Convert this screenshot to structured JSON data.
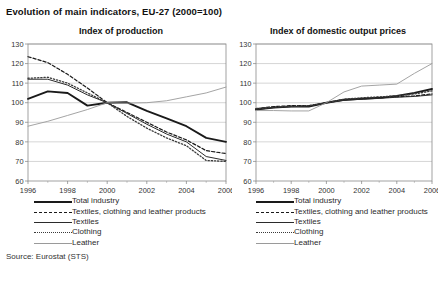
{
  "page_title": "Evolution of main indicators, EU-27 (2000=100)",
  "source_note": "Source: Eurostat (STS)",
  "legend": {
    "items": [
      {
        "label": "Total industry",
        "style": "solid-thick-black",
        "color": "#1a1a1a"
      },
      {
        "label": "Textiles, clothing and leather products",
        "style": "dashed-black",
        "color": "#1a1a1a"
      },
      {
        "label": "Textiles",
        "style": "solid-thick-dark",
        "color": "#2b2b2b"
      },
      {
        "label": "Clothing",
        "style": "dotted-dark",
        "color": "#3a3a3a"
      },
      {
        "label": "Leather",
        "style": "solid-thin-grey",
        "color": "#9a9a9a"
      }
    ]
  },
  "chart_data": [
    {
      "id": "index-of-production",
      "type": "line",
      "title": "Index of production",
      "xlabel": "",
      "ylabel": "",
      "x": [
        1996,
        1997,
        1998,
        1999,
        2000,
        2001,
        2002,
        2003,
        2004,
        2005,
        2006
      ],
      "tick_labels_x": [
        "1996",
        "1998",
        "2000",
        "2002",
        "2004",
        "2006"
      ],
      "tick_values_x": [
        1996,
        1998,
        2000,
        2002,
        2004,
        2006
      ],
      "tick_values_y": [
        60,
        70,
        80,
        90,
        100,
        110,
        120,
        130
      ],
      "ylim": [
        60,
        130
      ],
      "xlim": [
        1996,
        2006
      ],
      "grid": true,
      "legend_position": "below",
      "series": [
        {
          "name": "Total industry",
          "style": "solid-thick-black",
          "color": "#1a1a1a",
          "values": [
            102.0,
            105.8,
            105.0,
            98.5,
            100.0,
            100.2,
            95.8,
            92.0,
            88.0,
            82.0,
            80.0
          ]
        },
        {
          "name": "Textiles, clothing and leather products",
          "style": "dashed-black",
          "color": "#1a1a1a",
          "values": [
            123.5,
            120.5,
            114.5,
            107.5,
            100.0,
            95.0,
            90.0,
            85.0,
            81.0,
            75.5,
            74.0
          ]
        },
        {
          "name": "Textiles",
          "style": "solid-thick-dark",
          "color": "#2b2b2b",
          "values": [
            112.0,
            112.0,
            109.0,
            104.0,
            100.0,
            94.5,
            89.0,
            84.0,
            80.0,
            72.5,
            70.5
          ]
        },
        {
          "name": "Clothing",
          "style": "dotted-dark",
          "color": "#3a3a3a",
          "values": [
            112.5,
            113.0,
            110.0,
            105.0,
            100.0,
            93.0,
            87.0,
            82.0,
            78.0,
            70.5,
            70.0
          ]
        },
        {
          "name": "Leather",
          "style": "solid-thin-grey",
          "color": "#9a9a9a",
          "values": [
            88.0,
            90.5,
            93.5,
            96.5,
            100.0,
            99.8,
            100.0,
            101.0,
            103.0,
            105.0,
            108.0
          ]
        }
      ]
    },
    {
      "id": "index-of-domestic-output-prices",
      "type": "line",
      "title": "Index of domestic output prices",
      "xlabel": "",
      "ylabel": "",
      "x": [
        1996,
        1997,
        1998,
        1999,
        2000,
        2001,
        2002,
        2003,
        2004,
        2005,
        2006
      ],
      "tick_labels_x": [
        "1996",
        "1998",
        "2000",
        "2002",
        "2004",
        "2006"
      ],
      "tick_values_x": [
        1996,
        1998,
        2000,
        2002,
        2004,
        2006
      ],
      "tick_values_y": [
        60,
        70,
        80,
        90,
        100,
        110,
        120,
        130
      ],
      "ylim": [
        60,
        130
      ],
      "xlim": [
        1996,
        2006
      ],
      "grid": true,
      "legend_position": "below",
      "series": [
        {
          "name": "Total industry",
          "style": "solid-thick-black",
          "color": "#1a1a1a",
          "values": [
            96.5,
            97.5,
            98.0,
            98.0,
            100.0,
            101.5,
            102.0,
            102.5,
            103.5,
            105.0,
            107.0
          ]
        },
        {
          "name": "Textiles, clothing and leather products",
          "style": "dashed-black",
          "color": "#1a1a1a",
          "values": [
            97.0,
            98.0,
            98.5,
            98.5,
            100.0,
            101.5,
            102.0,
            102.5,
            103.0,
            103.5,
            104.5
          ]
        },
        {
          "name": "Textiles",
          "style": "solid-thick-dark",
          "color": "#2b2b2b",
          "values": [
            96.5,
            97.5,
            98.0,
            98.2,
            100.0,
            101.2,
            101.8,
            102.2,
            102.8,
            103.2,
            104.0
          ]
        },
        {
          "name": "Clothing",
          "style": "dotted-dark",
          "color": "#3a3a3a",
          "values": [
            97.0,
            97.8,
            98.2,
            98.5,
            100.0,
            101.8,
            102.5,
            103.0,
            103.5,
            104.5,
            106.0
          ]
        },
        {
          "name": "Leather",
          "style": "solid-thin-grey",
          "color": "#9a9a9a",
          "values": [
            96.0,
            96.0,
            95.8,
            95.8,
            100.0,
            105.5,
            108.5,
            109.0,
            109.5,
            115.0,
            120.0
          ]
        }
      ]
    }
  ]
}
